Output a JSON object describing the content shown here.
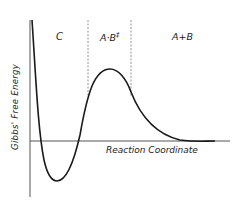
{
  "diagram": {
    "type": "energy-profile",
    "y_axis_label": "Gibbs' Free Energy",
    "x_axis_label": "Reaction Coordinate",
    "regions": [
      {
        "id": "C",
        "label": "C"
      },
      {
        "id": "transition",
        "label": "A·B",
        "superscript": "‡"
      },
      {
        "id": "products",
        "label": "A+B"
      }
    ],
    "colors": {
      "curve": "#1a1a1a",
      "axis": "#555555",
      "divider": "#888888",
      "text": "#222222"
    }
  }
}
